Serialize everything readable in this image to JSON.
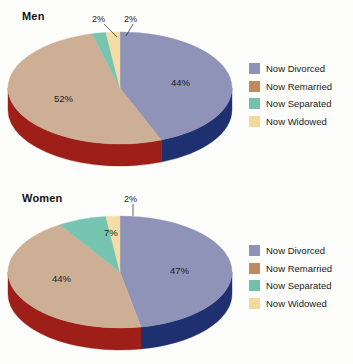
{
  "page": {
    "background": "#fdfdfc"
  },
  "palette": {
    "divorced_top": "#8f93b8",
    "divorced_side": "#1f3070",
    "remarried_top": "#cdaf96",
    "remarried_side": "#9d1f18",
    "separated_top": "#77c4b0",
    "separated_side": "#2f7f70",
    "widowed_top": "#f3dca6",
    "widowed_side": "#c9a866",
    "legend_divorced": "#8f93b8",
    "legend_remarried": "#c08a5e",
    "legend_separated": "#74c0aa",
    "legend_widowed": "#f5d99b",
    "label_text": "#1b1b1b",
    "leader_line": "#3a3a3a"
  },
  "charts": [
    {
      "id": "men",
      "title": "Men",
      "labels": [
        {
          "text": "44%",
          "x": 171,
          "y": 77
        },
        {
          "text": "52%",
          "x": 54,
          "y": 93
        },
        {
          "text": "2%",
          "x": 92,
          "y": 14,
          "callout": true
        },
        {
          "text": "2%",
          "x": 124,
          "y": 14,
          "callout": true
        }
      ],
      "legend": [
        {
          "label": "Now Divorced",
          "color": "#8f93b8"
        },
        {
          "label": "Now Remarried",
          "color": "#c08a5e"
        },
        {
          "label": "Now Separated",
          "color": "#74c0aa"
        },
        {
          "label": "Now Widowed",
          "color": "#f5d99b"
        }
      ]
    },
    {
      "id": "women",
      "title": "Women",
      "labels": [
        {
          "text": "47%",
          "x": 170,
          "y": 83
        },
        {
          "text": "44%",
          "x": 52,
          "y": 91
        },
        {
          "text": "7%",
          "x": 104,
          "y": 45
        },
        {
          "text": "2%",
          "x": 124,
          "y": 12,
          "callout": true
        }
      ],
      "legend": [
        {
          "label": "Now Divorced",
          "color": "#8f93b8"
        },
        {
          "label": "Now Remarried",
          "color": "#c08a5e"
        },
        {
          "label": "Now Separated",
          "color": "#74c0aa"
        },
        {
          "label": "Now Widowed",
          "color": "#f5d99b"
        }
      ]
    }
  ],
  "chart_data": [
    {
      "type": "pie",
      "title": "Men",
      "categories": [
        "Now Divorced",
        "Now Remarried",
        "Now Separated",
        "Now Widowed"
      ],
      "values": [
        44,
        52,
        2,
        2
      ],
      "unit": "%",
      "legend_position": "right",
      "three_d": true,
      "start_angle_deg": 0,
      "direction": "clockwise"
    },
    {
      "type": "pie",
      "title": "Women",
      "categories": [
        "Now Divorced",
        "Now Remarried",
        "Now Separated",
        "Now Widowed"
      ],
      "values": [
        47,
        44,
        7,
        2
      ],
      "unit": "%",
      "legend_position": "right",
      "three_d": true,
      "start_angle_deg": 0,
      "direction": "clockwise"
    }
  ]
}
